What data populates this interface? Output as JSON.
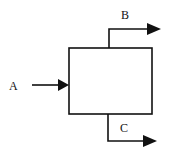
{
  "diagram": {
    "type": "process-block",
    "colors": {
      "stroke": "#111111",
      "background": "#ffffff"
    },
    "block": {
      "label": ""
    },
    "streams": [
      {
        "id": "A",
        "label": "A",
        "direction": "input",
        "side": "left"
      },
      {
        "id": "B",
        "label": "B",
        "direction": "output",
        "side": "top"
      },
      {
        "id": "C",
        "label": "C",
        "direction": "output",
        "side": "bottom"
      }
    ]
  }
}
